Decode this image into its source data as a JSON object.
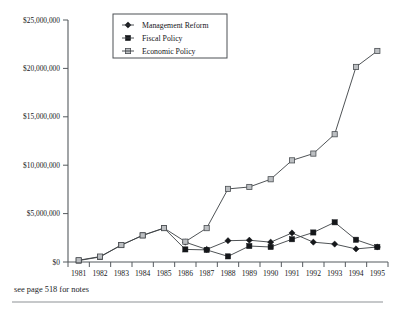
{
  "figure": {
    "note": "see page 518 for notes"
  },
  "legend": {
    "position": "top-center",
    "items": [
      {
        "label": "Management Reform",
        "marker": "filled-diamond",
        "color": "#15171a"
      },
      {
        "label": "Fiscal Policy",
        "marker": "filled-square",
        "color": "#15171a"
      },
      {
        "label": "Economic Policy",
        "marker": "open-square",
        "color": "#bcbfc2"
      }
    ]
  },
  "chart_data": {
    "type": "line",
    "title": "",
    "xlabel": "",
    "ylabel": "",
    "grid": false,
    "legend_position": "top-center",
    "categories": [
      "1981",
      "1982",
      "1983",
      "1984",
      "1985",
      "1986",
      "1987",
      "1988",
      "1989",
      "1990",
      "1991",
      "1992",
      "1993",
      "1994",
      "1995"
    ],
    "ylim": [
      0,
      25000000
    ],
    "yticks": [
      0,
      5000000,
      10000000,
      15000000,
      20000000,
      25000000
    ],
    "ytick_labels": [
      "$0",
      "$5,000,000",
      "$10,000,000",
      "$15,000,000",
      "$20,000,000",
      "$25,000,000"
    ],
    "series": [
      {
        "name": "Management Reform",
        "marker": "filled-diamond",
        "color": "#15171a",
        "x": [
          "1986",
          "1987",
          "1988",
          "1989",
          "1990",
          "1991",
          "1992",
          "1993",
          "1994",
          "1995"
        ],
        "values": [
          2050000,
          1300000,
          2200000,
          2250000,
          2050000,
          3000000,
          2050000,
          1850000,
          1350000,
          1550000
        ]
      },
      {
        "name": "Fiscal Policy",
        "marker": "filled-square",
        "color": "#15171a",
        "x": [
          "1981",
          "1982",
          "1983",
          "1984",
          "1985",
          "1986",
          "1987",
          "1988",
          "1989",
          "1990",
          "1991",
          "1992",
          "1993",
          "1994",
          "1995"
        ],
        "values": [
          150000,
          520000,
          1750000,
          2750000,
          3500000,
          1300000,
          1250000,
          580000,
          1650000,
          1550000,
          2350000,
          3050000,
          4100000,
          2300000,
          1550000
        ]
      },
      {
        "name": "Economic Policy",
        "marker": "open-square",
        "color": "#bcbfc2",
        "x": [
          "1981",
          "1982",
          "1983",
          "1984",
          "1985",
          "1986",
          "1987",
          "1988",
          "1989",
          "1990",
          "1991",
          "1992",
          "1993",
          "1994",
          "1995"
        ],
        "values": [
          180000,
          560000,
          1750000,
          2750000,
          3500000,
          2100000,
          3500000,
          7550000,
          7750000,
          8550000,
          10500000,
          11200000,
          13200000,
          20150000,
          21800000
        ]
      }
    ]
  }
}
